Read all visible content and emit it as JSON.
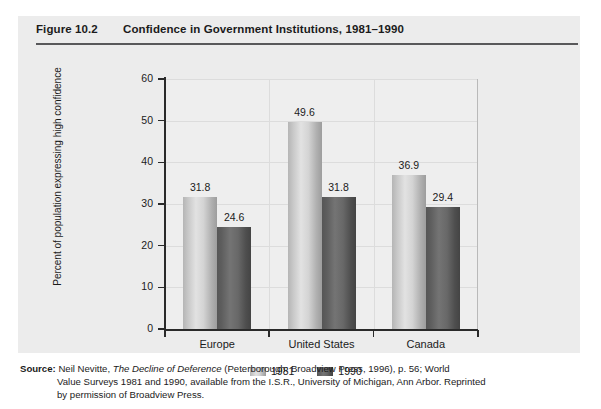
{
  "figure": {
    "number": "Figure 10.2",
    "title": "Confidence in Government Institutions, 1981–1990"
  },
  "chart_data": {
    "type": "bar",
    "title": "Confidence in Government Institutions, 1981–1990",
    "xlabel": "",
    "ylabel": "Percent of population expressing high confidence",
    "categories": [
      "Europe",
      "United States",
      "Canada"
    ],
    "series": [
      {
        "name": "1981",
        "values": [
          31.8,
          49.6,
          36.9
        ],
        "color": "#d4d4d4"
      },
      {
        "name": "1990",
        "values": [
          24.6,
          31.8,
          29.4
        ],
        "color": "#5e5e5e"
      }
    ],
    "ylim": [
      0,
      60
    ],
    "yticks": [
      0,
      10,
      20,
      30,
      40,
      50,
      60
    ],
    "ytick_labels": [
      "0",
      "10",
      "20",
      "30",
      "40",
      "50",
      "60"
    ],
    "grid": true,
    "legend_position": "bottom"
  },
  "source": {
    "label": "Source:",
    "line1_pre": "Neil Nevitte, ",
    "line1_italic": "The Decline of Deference",
    "line1_post": " (Peterborough: Broadview Press, 1996), p. 56; World",
    "line2": "Value Surveys 1981 and 1990, available from the I.S.R., University of Michigan, Ann Arbor. Reprinted",
    "line3": "by permission of Broadview Press."
  }
}
